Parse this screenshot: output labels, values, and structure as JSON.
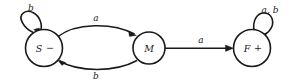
{
  "figure": {
    "kind": "finite-state-machine-diagram",
    "background_color": "#ffffff",
    "stroke_color": "#1a1a1a"
  },
  "states": [
    {
      "id": "S",
      "label": "S",
      "mark": "−",
      "mark_meaning": "non-accepting-start",
      "cx": 44,
      "cy": 48,
      "r": 18.5
    },
    {
      "id": "M",
      "label": "M",
      "mark": "",
      "mark_meaning": "intermediate",
      "cx": 149,
      "cy": 48,
      "r": 16
    },
    {
      "id": "F",
      "label": "F",
      "mark": "+",
      "mark_meaning": "accepting",
      "cx": 252,
      "cy": 48,
      "r": 18.5
    }
  ],
  "transitions": [
    {
      "id": "S-self",
      "from": "S",
      "to": "S",
      "label": "b",
      "kind": "self-loop",
      "label_x": 31,
      "label_y": 8
    },
    {
      "id": "S-to-M",
      "from": "S",
      "to": "M",
      "label": "a",
      "kind": "curve-top",
      "label_x": 96,
      "label_y": 18
    },
    {
      "id": "M-to-S",
      "from": "M",
      "to": "S",
      "label": "b",
      "kind": "curve-bottom",
      "label_x": 96,
      "label_y": 76
    },
    {
      "id": "M-to-F",
      "from": "M",
      "to": "F",
      "label": "a",
      "kind": "straight",
      "label_x": 201,
      "label_y": 40
    },
    {
      "id": "F-self",
      "from": "F",
      "to": "F",
      "label": "a, b",
      "kind": "self-loop",
      "label_x": 270,
      "label_y": 10
    }
  ]
}
